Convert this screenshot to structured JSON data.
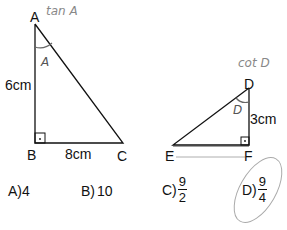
{
  "triangle1": {
    "vertices": {
      "A": "A",
      "B": "B",
      "C": "C"
    },
    "side_AB": "6cm",
    "side_BC": "8cm",
    "angle_mark": "A",
    "note": "tan A"
  },
  "triangle2": {
    "vertices": {
      "D": "D",
      "E": "E",
      "F": "F"
    },
    "side_DF": "3cm",
    "angle_mark": "D",
    "note": "cot D"
  },
  "options": {
    "a": {
      "label": "A)",
      "value": "4"
    },
    "b": {
      "label": "B)",
      "value": "10"
    },
    "c": {
      "label": "C)",
      "num": "9",
      "den": "2"
    },
    "d": {
      "label": "D)",
      "num": "9",
      "den": "4"
    }
  },
  "selected_option": "D"
}
